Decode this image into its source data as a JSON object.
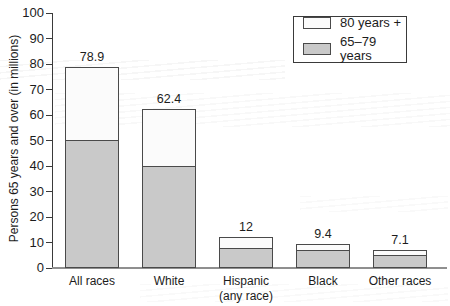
{
  "legend": {
    "items": [
      {
        "label": "80 years +",
        "swatch_color": "#fbfbfb"
      },
      {
        "label": "65–79 years",
        "swatch_color": "#c9c9c9"
      }
    ]
  },
  "chart_data": {
    "type": "bar",
    "stacked": true,
    "title": "",
    "xlabel": "",
    "ylabel": "Persons 65 years and over (in millions)",
    "ylim": [
      0,
      100
    ],
    "yticks": [
      0,
      10,
      20,
      30,
      40,
      50,
      60,
      70,
      80,
      90,
      100
    ],
    "grid": false,
    "legend_position": "upper right",
    "categories": [
      "All races",
      "White",
      "Hispanic",
      "Black",
      "Other races"
    ],
    "category_sublabels": [
      "",
      "",
      "(any race)",
      "",
      ""
    ],
    "series": [
      {
        "name": "65–79 years",
        "color": "#c9c9c9",
        "values": [
          49.4,
          39.1,
          6.9,
          6.1,
          4.3
        ]
      },
      {
        "name": "80 years +",
        "color": "#fbfbfb",
        "values": [
          29.5,
          23.3,
          5.1,
          3.3,
          2.8
        ]
      }
    ],
    "totals": [
      78.9,
      62.4,
      12,
      9.4,
      7.1
    ],
    "total_labels": [
      "78.9",
      "62.4",
      "12",
      "9.4",
      "7.1"
    ],
    "colors": {
      "bar_border": "#4a4a4a",
      "axis_line": "#3a3a3a",
      "baseline": "#8f8f8f",
      "text": "#1c1c1c"
    }
  }
}
